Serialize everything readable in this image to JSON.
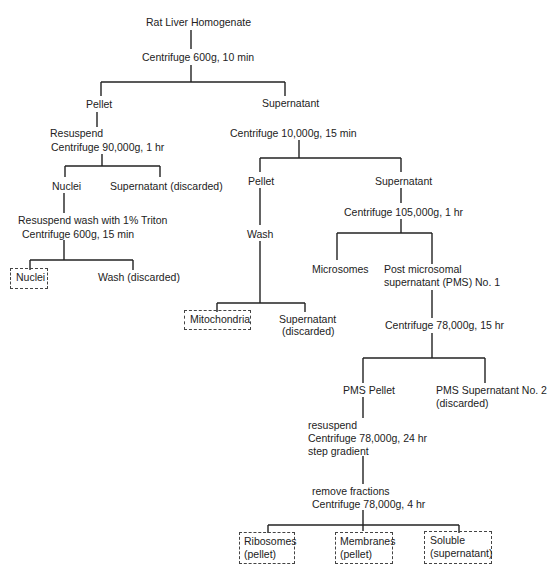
{
  "diagram": {
    "type": "flowchart",
    "title": "Rat Liver Homogenate",
    "nodes": {
      "root": "Rat Liver Homogenate",
      "spin1": "Centrifuge 600g, 10 min",
      "pellet1": "Pellet",
      "sup1": "Supernatant",
      "resuspend1": "Resuspend",
      "spin_90k": "Centrifuge 90,000g, 1 hr",
      "nuclei1": "Nuclei",
      "sup_discarded1": "Supernatant (discarded)",
      "triton_wash": "Resuspend wash with 1% Triton",
      "spin_600_15": "Centrifuge 600g, 15 min",
      "nuclei_final": "Nuclei",
      "wash_discarded": "Wash (discarded)",
      "spin_10k": "Centrifuge 10,000g, 15 min",
      "pellet2": "Pellet",
      "sup2": "Supernatant",
      "wash": "Wash",
      "mito_final": "Mitochondria",
      "sup_discarded2_l1": "Supernatant",
      "sup_discarded2_l2": "(discarded)",
      "spin_105k": "Centrifuge 105,000g, 1 hr",
      "microsomes": "Microsomes",
      "pms1_l1": "Post microsomal",
      "pms1_l2": "supernatant (PMS) No. 1",
      "spin_78k_15": "Centrifuge 78,000g, 15 hr",
      "pms_pellet": "PMS Pellet",
      "pms_sup2_l1": "PMS Supernatant No. 2",
      "pms_sup2_l2": "(discarded)",
      "resuspend2": "resuspend",
      "spin_78k_24": "Centrifuge 78,000g, 24 hr",
      "step_gradient": "step gradient",
      "remove_fractions": "remove fractions",
      "spin_78k_4": "Centrifuge 78,000g, 4 hr",
      "ribosomes_l1": "Ribosomes",
      "ribosomes_l2": "(pellet)",
      "membranes_l1": "Membranes",
      "membranes_l2": "(pellet)",
      "soluble_l1": "Soluble",
      "soluble_l2": "(supernatant)"
    },
    "final_products": [
      "Nuclei",
      "Mitochondria",
      "Ribosomes (pellet)",
      "Membranes (pellet)",
      "Soluble (supernatant)"
    ]
  }
}
